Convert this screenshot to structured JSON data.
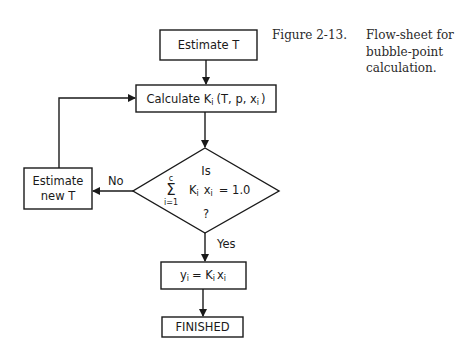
{
  "caption": {
    "number": "Figure 2-13.",
    "lines": [
      "Flow-sheet for",
      "bubble-point",
      "calculation."
    ]
  },
  "nodes": {
    "estimate_t": "Estimate T",
    "calculate_k": {
      "prefix": "Calculate K",
      "sub": "i",
      "args": "(T, p, x",
      "args_sub": "i",
      "close": ")"
    },
    "decision": {
      "top": "Is",
      "sum_top": "c",
      "sum_symbol": "Σ",
      "sum_bottom": "i=1",
      "expr_k": "K",
      "expr_k_sub": "i",
      "expr_x": "x",
      "expr_x_sub": "i",
      "expr_eq": "= 1.0",
      "bottom": "?"
    },
    "estimate_new_t": [
      "Estimate",
      "new T"
    ],
    "y_calc": {
      "y": "y",
      "y_sub": "i",
      "eq": "= K",
      "k_sub": "i",
      "x": "x",
      "x_sub": "i"
    },
    "finished": "FINISHED"
  },
  "edges": {
    "no_label": "No",
    "yes_label": "Yes"
  }
}
